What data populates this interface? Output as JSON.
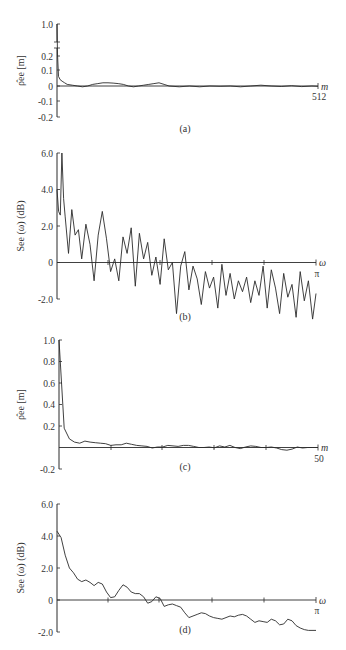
{
  "chart_data": [
    {
      "panel": "a",
      "type": "line",
      "caption": "(a)",
      "ylabel": "ρ̂ee [m]",
      "xlabel": "m",
      "x_end_label": "512",
      "xlim": [
        0,
        512
      ],
      "ylim": [
        -0.2,
        1.0
      ],
      "yticks": [
        "1.0",
        "0.2",
        "0.1",
        "0",
        "-0.1",
        "-0.2"
      ],
      "axis_break": true,
      "description": "Sample autocorrelation of white-noise-like sequence: value 1.0 at m=0, drops to ~0.05 by m=5, then fluctuates around 0 (about ±0.02) out to m=512.",
      "points": [
        [
          0,
          1.0
        ],
        [
          1,
          0.2
        ],
        [
          3,
          0.06
        ],
        [
          6,
          0.04
        ],
        [
          10,
          0.03
        ],
        [
          15,
          0.02
        ],
        [
          20,
          0.01
        ],
        [
          30,
          0.005
        ],
        [
          40,
          0.0
        ],
        [
          50,
          -0.005
        ],
        [
          60,
          0.0
        ],
        [
          70,
          0.01
        ],
        [
          80,
          0.015
        ],
        [
          90,
          0.02
        ],
        [
          100,
          0.02
        ],
        [
          110,
          0.018
        ],
        [
          120,
          0.015
        ],
        [
          130,
          0.01
        ],
        [
          140,
          0.0
        ],
        [
          150,
          -0.005
        ],
        [
          160,
          0.0
        ],
        [
          170,
          0.005
        ],
        [
          180,
          0.01
        ],
        [
          190,
          0.015
        ],
        [
          200,
          0.02
        ],
        [
          210,
          0.01
        ],
        [
          220,
          0.0
        ],
        [
          240,
          -0.005
        ],
        [
          260,
          0.0
        ],
        [
          280,
          -0.005
        ],
        [
          300,
          0.0
        ],
        [
          320,
          -0.002
        ],
        [
          340,
          0.0
        ],
        [
          360,
          -0.005
        ],
        [
          380,
          0.0
        ],
        [
          400,
          0.005
        ],
        [
          420,
          0.0
        ],
        [
          440,
          -0.003
        ],
        [
          460,
          0.002
        ],
        [
          480,
          -0.004
        ],
        [
          500,
          0.0
        ],
        [
          512,
          -0.002
        ]
      ]
    },
    {
      "panel": "b",
      "type": "line",
      "caption": "(b)",
      "ylabel": "See (ω) (dB)",
      "xlabel": "ω",
      "x_end_label": "π",
      "xlim": [
        0,
        3.1416
      ],
      "ylim": [
        -2.0,
        6.0
      ],
      "yticks": [
        "6.0",
        "4.0",
        "2.0",
        "0",
        "-2.0"
      ],
      "description": "Raw periodogram estimate in dB: very noisy, peaks near 6.0 dB at low frequency, trending downward to about -1.5 dB at ω=π with spikes down to -3 dB.",
      "points": [
        [
          0.0,
          4.0
        ],
        [
          0.02,
          2.8
        ],
        [
          0.04,
          2.6
        ],
        [
          0.06,
          6.0
        ],
        [
          0.08,
          3.5
        ],
        [
          0.1,
          2.5
        ],
        [
          0.14,
          0.5
        ],
        [
          0.18,
          2.9
        ],
        [
          0.22,
          1.5
        ],
        [
          0.26,
          1.8
        ],
        [
          0.3,
          0.2
        ],
        [
          0.35,
          2.1
        ],
        [
          0.4,
          1.0
        ],
        [
          0.45,
          -1.0
        ],
        [
          0.5,
          1.5
        ],
        [
          0.55,
          2.8
        ],
        [
          0.6,
          1.3
        ],
        [
          0.65,
          -0.5
        ],
        [
          0.7,
          0.2
        ],
        [
          0.75,
          -1.0
        ],
        [
          0.8,
          1.4
        ],
        [
          0.85,
          0.5
        ],
        [
          0.9,
          1.9
        ],
        [
          0.95,
          -1.3
        ],
        [
          1.0,
          1.6
        ],
        [
          1.05,
          0.2
        ],
        [
          1.1,
          1.1
        ],
        [
          1.15,
          -0.7
        ],
        [
          1.2,
          0.3
        ],
        [
          1.25,
          -1.2
        ],
        [
          1.3,
          1.3
        ],
        [
          1.35,
          -0.4
        ],
        [
          1.4,
          0.0
        ],
        [
          1.45,
          -2.8
        ],
        [
          1.5,
          -0.2
        ],
        [
          1.55,
          0.6
        ],
        [
          1.6,
          -1.5
        ],
        [
          1.65,
          -0.2
        ],
        [
          1.7,
          -0.9
        ],
        [
          1.75,
          -2.3
        ],
        [
          1.8,
          -0.5
        ],
        [
          1.85,
          -1.4
        ],
        [
          1.9,
          -0.8
        ],
        [
          1.95,
          -2.5
        ],
        [
          2.0,
          -0.1
        ],
        [
          2.05,
          -1.8
        ],
        [
          2.1,
          -0.6
        ],
        [
          2.15,
          -2.0
        ],
        [
          2.2,
          -1.0
        ],
        [
          2.25,
          -1.6
        ],
        [
          2.3,
          -0.8
        ],
        [
          2.35,
          -2.2
        ],
        [
          2.4,
          -1.0
        ],
        [
          2.45,
          -1.8
        ],
        [
          2.5,
          -0.2
        ],
        [
          2.55,
          -2.5
        ],
        [
          2.6,
          -0.4
        ],
        [
          2.65,
          -1.4
        ],
        [
          2.7,
          -2.8
        ],
        [
          2.75,
          -0.6
        ],
        [
          2.8,
          -1.9
        ],
        [
          2.85,
          -1.2
        ],
        [
          2.9,
          -3.0
        ],
        [
          2.95,
          -0.5
        ],
        [
          3.0,
          -2.1
        ],
        [
          3.05,
          -1.0
        ],
        [
          3.1,
          -3.1
        ],
        [
          3.1416,
          -1.7
        ]
      ]
    },
    {
      "panel": "c",
      "type": "line",
      "caption": "(c)",
      "ylabel": "ρ̂ee [m]",
      "xlabel": "m",
      "x_end_label": "50",
      "xlim": [
        0,
        50
      ],
      "ylim": [
        -0.2,
        1.0
      ],
      "yticks": [
        "1.0",
        "0.8",
        "0.6",
        "0.4",
        "0.2",
        "-0.2"
      ],
      "description": "Autocorrelation over first 50 lags: 1.0 at m=0, sharp drop to ~0.2 at m=1, decays slowly to near 0 by m=20, small fluctuations thereafter.",
      "points": [
        [
          0,
          1.0
        ],
        [
          1,
          0.18
        ],
        [
          2,
          0.08
        ],
        [
          3,
          0.05
        ],
        [
          4,
          0.04
        ],
        [
          5,
          0.06
        ],
        [
          6,
          0.05
        ],
        [
          7,
          0.045
        ],
        [
          8,
          0.04
        ],
        [
          9,
          0.035
        ],
        [
          10,
          0.02
        ],
        [
          11,
          0.025
        ],
        [
          12,
          0.025
        ],
        [
          13,
          0.04
        ],
        [
          14,
          0.03
        ],
        [
          15,
          0.02
        ],
        [
          16,
          0.015
        ],
        [
          17,
          0.01
        ],
        [
          18,
          -0.005
        ],
        [
          19,
          0.005
        ],
        [
          20,
          0.005
        ],
        [
          21,
          0.02
        ],
        [
          22,
          0.015
        ],
        [
          23,
          0.01
        ],
        [
          24,
          0.02
        ],
        [
          25,
          0.02
        ],
        [
          26,
          0.01
        ],
        [
          27,
          0.0
        ],
        [
          28,
          0.0
        ],
        [
          29,
          0.005
        ],
        [
          30,
          -0.003
        ],
        [
          31,
          0.015
        ],
        [
          32,
          0.005
        ],
        [
          33,
          0.02
        ],
        [
          34,
          0.0
        ],
        [
          35,
          -0.01
        ],
        [
          36,
          0.005
        ],
        [
          37,
          0.015
        ],
        [
          38,
          0.01
        ],
        [
          39,
          0.0
        ],
        [
          40,
          0.0
        ],
        [
          41,
          0.005
        ],
        [
          42,
          -0.005
        ],
        [
          43,
          -0.02
        ],
        [
          44,
          -0.025
        ],
        [
          45,
          -0.015
        ],
        [
          46,
          0.005
        ],
        [
          47,
          -0.005
        ],
        [
          48,
          0.0
        ],
        [
          49,
          0.0
        ],
        [
          50,
          0.0
        ]
      ]
    },
    {
      "panel": "d",
      "type": "line",
      "caption": "(d)",
      "ylabel": "See (ω) (dB)",
      "xlabel": "ω",
      "x_end_label": "π",
      "xlim": [
        0,
        3.1416
      ],
      "ylim": [
        -2.0,
        6.0
      ],
      "yticks": [
        "6.0",
        "4.0",
        "2.0",
        "0",
        "-2.0"
      ],
      "description": "Smoothed spectrum estimate in dB: starts ~4.3 dB at ω=0, decreases with ripples through 0 near ω≈1.1, ending near -1.9 dB at ω=π.",
      "points": [
        [
          0.0,
          4.3
        ],
        [
          0.05,
          3.9
        ],
        [
          0.1,
          2.8
        ],
        [
          0.15,
          2.0
        ],
        [
          0.2,
          1.7
        ],
        [
          0.25,
          1.3
        ],
        [
          0.3,
          1.15
        ],
        [
          0.35,
          1.25
        ],
        [
          0.4,
          1.1
        ],
        [
          0.45,
          0.9
        ],
        [
          0.5,
          1.1
        ],
        [
          0.55,
          1.0
        ],
        [
          0.6,
          0.5
        ],
        [
          0.65,
          0.15
        ],
        [
          0.7,
          0.2
        ],
        [
          0.75,
          0.6
        ],
        [
          0.8,
          0.95
        ],
        [
          0.85,
          0.8
        ],
        [
          0.9,
          0.5
        ],
        [
          0.95,
          0.4
        ],
        [
          1.0,
          0.4
        ],
        [
          1.05,
          0.2
        ],
        [
          1.1,
          -0.2
        ],
        [
          1.15,
          -0.1
        ],
        [
          1.2,
          0.2
        ],
        [
          1.25,
          0.1
        ],
        [
          1.3,
          -0.4
        ],
        [
          1.35,
          -0.3
        ],
        [
          1.4,
          -0.25
        ],
        [
          1.45,
          -0.35
        ],
        [
          1.5,
          -0.45
        ],
        [
          1.55,
          -0.8
        ],
        [
          1.6,
          -1.1
        ],
        [
          1.65,
          -1.0
        ],
        [
          1.7,
          -0.9
        ],
        [
          1.75,
          -0.8
        ],
        [
          1.8,
          -0.85
        ],
        [
          1.85,
          -1.0
        ],
        [
          1.9,
          -1.1
        ],
        [
          1.95,
          -1.15
        ],
        [
          2.0,
          -1.2
        ],
        [
          2.05,
          -1.1
        ],
        [
          2.1,
          -1.0
        ],
        [
          2.15,
          -1.05
        ],
        [
          2.2,
          -0.95
        ],
        [
          2.25,
          -0.9
        ],
        [
          2.3,
          -1.0
        ],
        [
          2.35,
          -1.2
        ],
        [
          2.4,
          -1.4
        ],
        [
          2.45,
          -1.3
        ],
        [
          2.5,
          -1.35
        ],
        [
          2.55,
          -1.4
        ],
        [
          2.6,
          -1.2
        ],
        [
          2.65,
          -1.3
        ],
        [
          2.7,
          -1.55
        ],
        [
          2.75,
          -1.5
        ],
        [
          2.8,
          -1.2
        ],
        [
          2.85,
          -1.3
        ],
        [
          2.9,
          -1.6
        ],
        [
          2.95,
          -1.75
        ],
        [
          3.0,
          -1.85
        ],
        [
          3.05,
          -1.9
        ],
        [
          3.1416,
          -1.9
        ]
      ]
    }
  ],
  "layout": {
    "panels": {
      "a": {
        "x0": 57,
        "x1": 318,
        "y_tick_px": {
          "1.0": 24,
          "0.2": 56,
          "0.1": 70,
          "0": 86,
          "-0.1": 101,
          "-0.2": 117
        },
        "caption_x": 185,
        "caption_y": 132
      },
      "b": {
        "x0": 57,
        "x1": 316,
        "y_top": 153,
        "y_bottom": 299,
        "caption_x": 185,
        "caption_y": 320
      },
      "c": {
        "x0": 59,
        "x1": 318,
        "y_top": 340,
        "y_bottom": 469,
        "caption_x": 185,
        "caption_y": 470
      },
      "d": {
        "x0": 57,
        "x1": 316,
        "y_top": 504,
        "y_bottom": 632,
        "caption_x": 185,
        "caption_y": 633
      }
    }
  }
}
